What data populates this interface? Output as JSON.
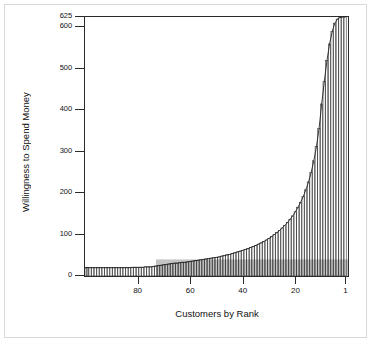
{
  "chart_data": {
    "type": "bar",
    "title": "",
    "subtitle": "",
    "xlabel": "Customers by Rank",
    "ylabel": "Willingness to Spend Money",
    "xlim": [
      100,
      0
    ],
    "ylim": [
      0,
      625
    ],
    "x_ticks": [
      80,
      60,
      40,
      20,
      1
    ],
    "x_tick_labels": [
      "80",
      "60",
      "40",
      "20",
      "1"
    ],
    "y_ticks": [
      0,
      100,
      200,
      300,
      400,
      500,
      600,
      625
    ],
    "y_tick_labels": [
      "0",
      "100",
      "200",
      "300",
      "400",
      "500",
      "600",
      "625"
    ],
    "grid": false,
    "legend": null,
    "x_axis_direction": "descending",
    "series": [
      {
        "name": "Willingness to Spend Money",
        "x": [
          100,
          99,
          98,
          97,
          96,
          95,
          94,
          93,
          92,
          91,
          90,
          89,
          88,
          87,
          86,
          85,
          84,
          83,
          82,
          81,
          80,
          79,
          78,
          77,
          76,
          75,
          74,
          73,
          72,
          71,
          70,
          69,
          68,
          67,
          66,
          65,
          64,
          63,
          62,
          61,
          60,
          59,
          58,
          57,
          56,
          55,
          54,
          53,
          52,
          51,
          50,
          49,
          48,
          47,
          46,
          45,
          44,
          43,
          42,
          41,
          40,
          39,
          38,
          37,
          36,
          35,
          34,
          33,
          32,
          31,
          30,
          29,
          28,
          27,
          26,
          25,
          24,
          23,
          22,
          21,
          20,
          19,
          18,
          17,
          16,
          15,
          14,
          13,
          12,
          11,
          10,
          9,
          8,
          7,
          6,
          5,
          4,
          3,
          2,
          1
        ],
        "values": [
          20,
          20,
          20,
          20,
          20,
          20,
          20,
          20,
          20,
          20,
          20,
          20,
          20,
          20,
          20,
          20,
          20,
          20,
          21,
          21,
          21,
          21,
          21,
          22,
          22,
          22,
          23,
          24,
          25,
          26,
          27,
          28,
          29,
          30,
          31,
          31,
          32,
          33,
          33,
          34,
          35,
          36,
          37,
          38,
          39,
          40,
          41,
          42,
          43,
          44,
          45,
          46,
          48,
          49,
          51,
          52,
          54,
          56,
          58,
          60,
          62,
          64,
          66,
          69,
          71,
          74,
          77,
          80,
          83,
          87,
          91,
          95,
          100,
          105,
          110,
          116,
          122,
          129,
          137,
          145,
          155,
          166,
          178,
          192,
          208,
          227,
          250,
          278,
          312,
          356,
          415,
          470,
          520,
          560,
          590,
          610,
          620,
          624,
          625,
          625
        ]
      }
    ],
    "shaded_region": {
      "label": "revenue rectangle",
      "color": "#c9c9c9",
      "price": 40,
      "x_from": 73,
      "x_to": 1
    }
  },
  "colors": {
    "bar_fill": "#ffffff",
    "bar_stroke": "#222222",
    "shade_fill": "#c4c4c4",
    "axis": "#2b2b2b",
    "frame": "#d8d8d8",
    "text": "#111111"
  }
}
